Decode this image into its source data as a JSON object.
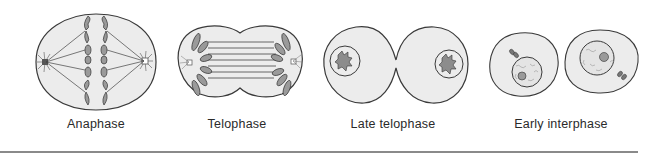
{
  "figure": {
    "panels": [
      {
        "id": "anaphase",
        "label": "Anaphase",
        "label_x": 96
      },
      {
        "id": "telophase",
        "label": "Telophase",
        "label_x": 237
      },
      {
        "id": "late-telophase",
        "label": "Late telophase",
        "label_x": 393
      },
      {
        "id": "early-interphase",
        "label": "Early interphase",
        "label_x": 561
      }
    ],
    "colors": {
      "cell_fill": "#ececec",
      "outline": "#3a3a3a",
      "chromosome": "#8c8c8c",
      "divider": "#8a8a8a"
    }
  }
}
